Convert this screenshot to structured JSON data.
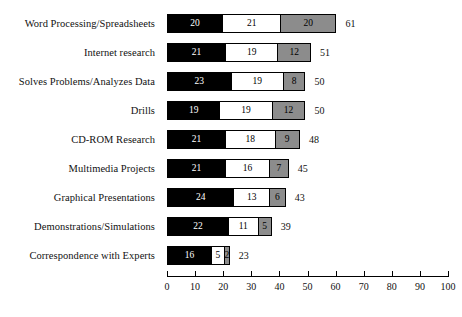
{
  "chart_data": {
    "type": "bar",
    "orientation": "horizontal",
    "stacked": true,
    "title": "",
    "subtitle": "",
    "xlabel": "",
    "ylabel": "",
    "xlim": [
      0,
      100
    ],
    "xticks": [
      0,
      10,
      20,
      30,
      40,
      50,
      60,
      70,
      80,
      90,
      100
    ],
    "xtick_labels": [
      "0",
      "10",
      "20",
      "30",
      "40",
      "50",
      "60",
      "70",
      "80",
      "90",
      "100"
    ],
    "grid": false,
    "legend": "none",
    "categories": [
      "Word Processing/Spreadsheets",
      "Internet research",
      "Solves Problems/Analyzes Data",
      "Drills",
      "CD-ROM Research",
      "Multimedia Projects",
      "Graphical Presentations",
      "Demonstrations/Simulations",
      "Correspondence with Experts"
    ],
    "series": [
      {
        "name": "segment-1",
        "color": "#000000",
        "text_color": "#ffffff",
        "values": [
          20,
          21,
          23,
          19,
          21,
          21,
          24,
          22,
          16
        ]
      },
      {
        "name": "segment-2",
        "color": "#ffffff",
        "text_color": "#000000",
        "values": [
          21,
          19,
          19,
          19,
          18,
          16,
          13,
          11,
          5
        ]
      },
      {
        "name": "segment-3",
        "color": "#8c8c8c",
        "text_color": "#000000",
        "values": [
          20,
          12,
          8,
          12,
          9,
          7,
          6,
          5,
          2
        ]
      }
    ],
    "totals": [
      61,
      51,
      50,
      50,
      48,
      45,
      43,
      39,
      23
    ],
    "rows": [
      {
        "label": "Word Processing/Spreadsheets",
        "segments": [
          20,
          21,
          20
        ],
        "total": 61
      },
      {
        "label": "Internet research",
        "segments": [
          21,
          19,
          12
        ],
        "total": 51
      },
      {
        "label": "Solves Problems/Analyzes Data",
        "segments": [
          23,
          19,
          8
        ],
        "total": 50
      },
      {
        "label": "Drills",
        "segments": [
          19,
          19,
          12
        ],
        "total": 50
      },
      {
        "label": "CD-ROM Research",
        "segments": [
          21,
          18,
          9
        ],
        "total": 48
      },
      {
        "label": "Multimedia Projects",
        "segments": [
          21,
          16,
          7
        ],
        "total": 45
      },
      {
        "label": "Graphical Presentations",
        "segments": [
          24,
          13,
          6
        ],
        "total": 43
      },
      {
        "label": "Demonstrations/Simulations",
        "segments": [
          22,
          11,
          5
        ],
        "total": 39
      },
      {
        "label": "Correspondence with Experts",
        "segments": [
          16,
          5,
          2
        ],
        "total": 23
      }
    ]
  }
}
